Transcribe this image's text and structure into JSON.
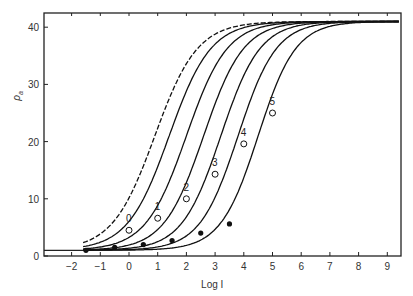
{
  "chart_data": {
    "type": "line",
    "title": "",
    "xlabel": "Log I",
    "ylabel": "ρa",
    "xlim": [
      -3,
      9.5
    ],
    "ylim": [
      0,
      43
    ],
    "xticks": [
      "-2",
      "-1",
      "0",
      "1",
      "2",
      "3",
      "4",
      "5",
      "6",
      "7",
      "8",
      "9"
    ],
    "yticks": [
      "0",
      "10",
      "20",
      "30",
      "40"
    ],
    "grid": false,
    "legend": "none",
    "series": [
      {
        "name": "dashed",
        "style": "dashed",
        "midpoint_logI": 0.9,
        "plateau": 41
      },
      {
        "name": "0",
        "style": "solid",
        "midpoint_logI": 1.4,
        "plateau": 41,
        "labeled_point": [
          0,
          4.5
        ]
      },
      {
        "name": "1",
        "style": "solid",
        "midpoint_logI": 2.0,
        "plateau": 41,
        "labeled_point": [
          1,
          6.6
        ]
      },
      {
        "name": "2",
        "style": "solid",
        "midpoint_logI": 2.6,
        "plateau": 41,
        "labeled_point": [
          2,
          10
        ]
      },
      {
        "name": "3",
        "style": "solid",
        "midpoint_logI": 3.2,
        "plateau": 41,
        "labeled_point": [
          3,
          14.3
        ]
      },
      {
        "name": "4",
        "style": "solid",
        "midpoint_logI": 3.8,
        "plateau": 41,
        "labeled_point": [
          4,
          19.6
        ]
      },
      {
        "name": "5",
        "style": "solid",
        "midpoint_logI": 4.5,
        "plateau": 41,
        "labeled_point": [
          5,
          25
        ]
      }
    ],
    "filled_points": [
      [
        -1.5,
        1
      ],
      [
        -0.5,
        1.5
      ],
      [
        0.5,
        2.0
      ],
      [
        1.5,
        2.7
      ],
      [
        2.5,
        4.0
      ],
      [
        3.5,
        5.6
      ]
    ],
    "baseline": 1,
    "annotations": [
      "0",
      "1",
      "2",
      "3",
      "4",
      "5"
    ]
  },
  "axes": {
    "xlabel": "Log I",
    "ylabel": "ρ",
    "ylabel_sub": "a"
  }
}
